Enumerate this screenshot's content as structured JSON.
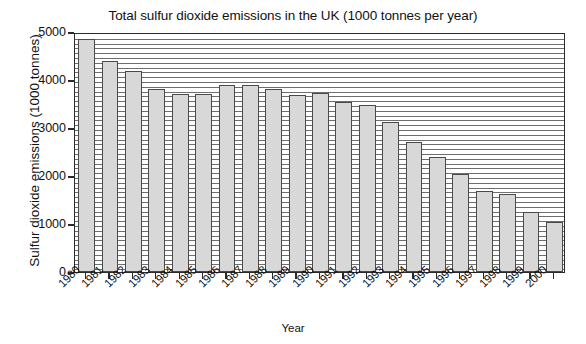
{
  "chart_data": {
    "type": "bar",
    "title": "Total sulfur dioxide emissions in the UK (1000 tonnes per year)",
    "xlabel": "Year",
    "ylabel": "Sulfur dioxide emissions (1000 tonnes)",
    "categories": [
      "1980",
      "1981",
      "1982",
      "1983",
      "1984",
      "1985",
      "1986",
      "1987",
      "1988",
      "1989",
      "1990",
      "1991",
      "1992",
      "1993",
      "1994",
      "1995",
      "1996",
      "1997",
      "1998",
      "1999",
      "2000"
    ],
    "values": [
      4850,
      4400,
      4180,
      3820,
      3700,
      3700,
      3900,
      3900,
      3820,
      3680,
      3720,
      3550,
      3480,
      3120,
      2700,
      2400,
      2050,
      1680,
      1620,
      1250,
      1050
    ],
    "ylim": [
      0,
      5000
    ],
    "ytick_labels": [
      "0",
      "1000",
      "2000",
      "3000",
      "4000",
      "5000"
    ],
    "ytick_values": [
      0,
      1000,
      2000,
      3000,
      4000,
      5000
    ],
    "grid": "horizontal",
    "grid_interval": 100,
    "legend": "none",
    "bar_fill_color": "#d8d8d8",
    "bar_edge_color": "#4a4a4a",
    "axis_color": "#2b2b2b",
    "gridline_color": "#6e6e6e"
  }
}
